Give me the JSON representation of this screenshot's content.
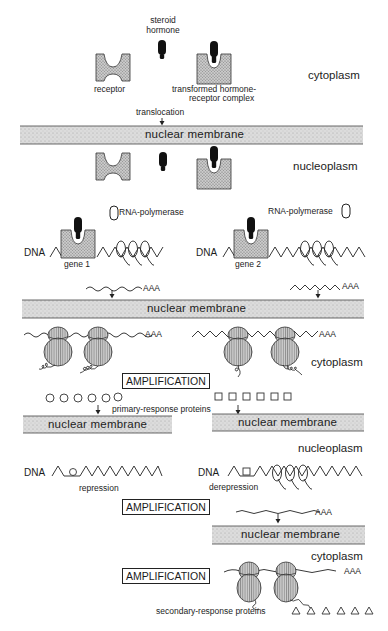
{
  "figure": {
    "type": "steroid hormone action mechanism",
    "compartments": {
      "cytoplasm_top": "cytoplasm",
      "nucleoplasm_1": "nucleoplasm",
      "cytoplasm_mid": "cytoplasm",
      "nucleoplasm_2": "nucleoplasm",
      "cytoplasm_bottom": "cytoplasm"
    },
    "labels": {
      "steroid_hormone_line1": "steroid",
      "steroid_hormone_line2": "hormone",
      "receptor": "receptor",
      "complex_line1": "transformed hormone-",
      "complex_line2": "receptor complex",
      "translocation": "translocation",
      "rna_polymerase_left": "RNA-polymerase",
      "rna_polymerase_right": "RNA-polymerase",
      "dna_gene1": "DNA",
      "dna_gene2": "DNA",
      "gene1": "gene  1",
      "gene2": "gene  2",
      "polya_1": "AAA",
      "polya_2": "AAA",
      "polya_3": "AAA",
      "polya_4": "AAA",
      "polya_5": "AAA",
      "polya_6": "AAA",
      "primary_response": "primary-response proteins",
      "dna_repression": "DNA",
      "dna_derepression": "DNA",
      "repression": "repression",
      "derepression": "derepression",
      "secondary_response": "secondary-response proteins"
    },
    "membranes": {
      "m1": "nuclear  membrane",
      "m2": "nuclear  membrane",
      "m3_left": "nuclear  membrane",
      "m3_right": "nuclear  membrane",
      "m4": "nuclear  membrane"
    },
    "amplification": {
      "a1": "AMPLIFICATION",
      "a2": "AMPLIFICATION",
      "a3": "AMPLIFICATION"
    },
    "symbols": {
      "primary_response_left": "circle",
      "primary_response_right": "square",
      "secondary_response": "triangle",
      "primary_left_count": 6,
      "primary_right_count": 6,
      "secondary_count": 6
    },
    "colors": {
      "ink": "#1c1c1c",
      "membrane_fill": "#d9d9d9",
      "receptor_fill": "#bdbdbd",
      "hormone_fill": "#111111",
      "ribosome_fill": "#c8c8c8"
    }
  }
}
